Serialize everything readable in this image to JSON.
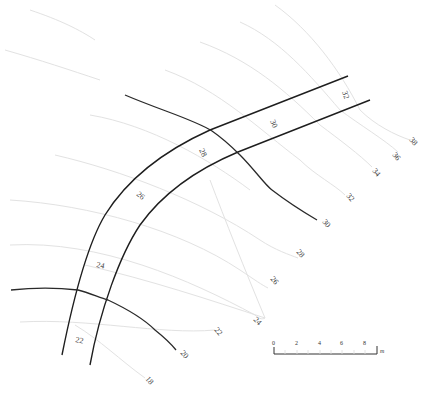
{
  "diagram": {
    "type": "contour-road-map",
    "colors": {
      "background": "#ffffff",
      "faint_contour": "#e2e2e2",
      "dark_contour": "#2a2a2a",
      "road_edge": "#1e1e1e",
      "label": "#444444"
    },
    "contour_labels": {
      "c18": "18",
      "c20": "20",
      "c22_outer": "22",
      "c22_road": "22",
      "c24_outer": "24",
      "c24_road": "24",
      "c26_outer": "26",
      "c26_road": "26",
      "c28_outer": "28",
      "c28_road": "28",
      "c30_outer": "30",
      "c30_road": "30",
      "c32_outer": "32",
      "c32_road": "32",
      "c34": "34",
      "c36": "36",
      "c38": "38"
    },
    "scale_bar": {
      "ticks": [
        "0",
        "2",
        "4",
        "6",
        "8"
      ],
      "unit": "m"
    }
  }
}
